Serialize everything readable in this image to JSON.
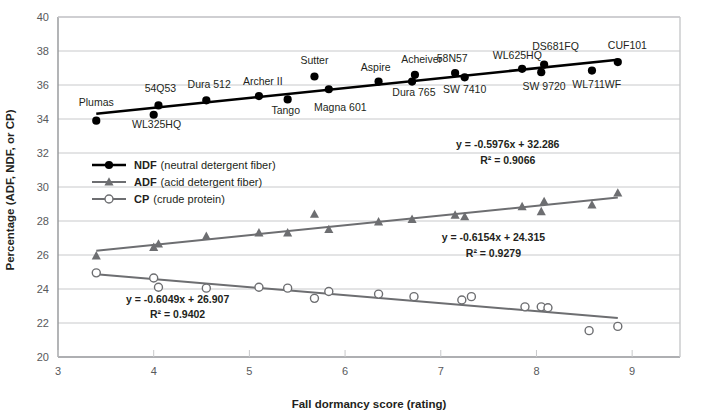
{
  "chart_data": {
    "type": "scatter",
    "title": "",
    "xlabel": "Fall dormancy score (rating)",
    "ylabel": "Percentage (ADF, NDF, or CP)",
    "xlim": [
      3,
      9.5
    ],
    "ylim": [
      20,
      40
    ],
    "xticks": [
      3,
      4,
      5,
      6,
      7,
      8,
      9
    ],
    "yticks": [
      20,
      22,
      24,
      26,
      28,
      30,
      32,
      34,
      36,
      38,
      40
    ],
    "grid": true,
    "legend_position": "inside-upper-left",
    "series": [
      {
        "name": "NDF",
        "legend_key": "NDF",
        "legend_desc": "(neutral detergent fiber)",
        "marker": "filled-circle",
        "color": "#000000",
        "equation": "y = -0.5976x + 32.286",
        "r2": "R² = 0.9066",
        "trend_slope": 0.5976,
        "trend_intercept": 32.286,
        "points": [
          {
            "label": "Plumas",
            "x": 3.4,
            "y": 33.9,
            "lx": 3.4,
            "ly": 34.75,
            "anchor": "middle"
          },
          {
            "label": "WL325HQ",
            "x": 4.0,
            "y": 34.25,
            "lx": 4.03,
            "ly": 33.45,
            "anchor": "middle"
          },
          {
            "label": "54Q53",
            "x": 4.05,
            "y": 34.8,
            "lx": 4.07,
            "ly": 35.6,
            "anchor": "middle"
          },
          {
            "label": "Dura 512",
            "x": 4.55,
            "y": 35.1,
            "lx": 4.58,
            "ly": 35.8,
            "anchor": "middle"
          },
          {
            "label": "Archer II",
            "x": 5.1,
            "y": 35.35,
            "lx": 5.14,
            "ly": 36.0,
            "anchor": "middle"
          },
          {
            "label": "Tango",
            "x": 5.4,
            "y": 35.15,
            "lx": 5.38,
            "ly": 34.3,
            "anchor": "middle"
          },
          {
            "label": "Sutter",
            "x": 5.68,
            "y": 36.5,
            "lx": 5.68,
            "ly": 37.25,
            "anchor": "middle"
          },
          {
            "label": "Magna 601",
            "x": 5.83,
            "y": 35.75,
            "lx": 5.95,
            "ly": 34.5,
            "anchor": "middle"
          },
          {
            "label": "Aspire",
            "x": 6.35,
            "y": 36.2,
            "lx": 6.32,
            "ly": 36.85,
            "anchor": "middle"
          },
          {
            "label": "Dura 765",
            "x": 6.7,
            "y": 36.2,
            "lx": 6.72,
            "ly": 35.35,
            "anchor": "middle"
          },
          {
            "label": "Acheiver",
            "x": 6.73,
            "y": 36.6,
            "lx": 6.8,
            "ly": 37.3,
            "anchor": "middle"
          },
          {
            "label": "SW 7410",
            "x": 7.25,
            "y": 36.45,
            "lx": 7.25,
            "ly": 35.55,
            "anchor": "middle"
          },
          {
            "label": "58N57",
            "x": 7.15,
            "y": 36.7,
            "lx": 7.12,
            "ly": 37.35,
            "anchor": "middle"
          },
          {
            "label": "SW 9720",
            "x": 8.05,
            "y": 36.75,
            "lx": 8.08,
            "ly": 35.7,
            "anchor": "middle"
          },
          {
            "label": "WL625HQ",
            "x": 7.85,
            "y": 36.95,
            "lx": 7.8,
            "ly": 37.55,
            "anchor": "middle"
          },
          {
            "label": "DS681FQ",
            "x": 8.08,
            "y": 37.2,
            "lx": 8.2,
            "ly": 38.05,
            "anchor": "middle"
          },
          {
            "label": "WL711WF",
            "x": 8.58,
            "y": 36.85,
            "lx": 8.63,
            "ly": 35.85,
            "anchor": "middle"
          },
          {
            "label": "CUF101",
            "x": 8.85,
            "y": 37.35,
            "lx": 8.95,
            "ly": 38.1,
            "anchor": "middle"
          }
        ]
      },
      {
        "name": "ADF",
        "legend_key": "ADF",
        "legend_desc": "(acid detergent fiber)",
        "marker": "filled-triangle",
        "color": "#6d6e71",
        "equation": "y = -0.6154x + 24.315",
        "r2": "R² = 0.9279",
        "trend_slope": 0.6154,
        "trend_intercept": 24.315,
        "points": [
          {
            "x": 3.4,
            "y": 25.95
          },
          {
            "x": 4.0,
            "y": 26.45
          },
          {
            "x": 4.05,
            "y": 26.65
          },
          {
            "x": 4.55,
            "y": 27.1
          },
          {
            "x": 5.1,
            "y": 27.3
          },
          {
            "x": 5.4,
            "y": 27.3
          },
          {
            "x": 5.68,
            "y": 28.4
          },
          {
            "x": 5.83,
            "y": 27.5
          },
          {
            "x": 6.35,
            "y": 27.95
          },
          {
            "x": 6.7,
            "y": 28.1
          },
          {
            "x": 7.15,
            "y": 28.35
          },
          {
            "x": 7.25,
            "y": 28.25
          },
          {
            "x": 7.85,
            "y": 28.85
          },
          {
            "x": 8.05,
            "y": 28.55
          },
          {
            "x": 8.08,
            "y": 29.15
          },
          {
            "x": 8.58,
            "y": 28.95
          },
          {
            "x": 8.85,
            "y": 29.65
          }
        ]
      },
      {
        "name": "CP",
        "legend_key": "CP",
        "legend_desc": "(crude protein)",
        "marker": "open-circle",
        "color": "#6d6e71",
        "equation": "y = -0.6049x + 26.907",
        "r2": "R² = 0.9402",
        "trend_slope": -0.6049,
        "trend_intercept": 26.907,
        "points": [
          {
            "x": 3.4,
            "y": 24.95
          },
          {
            "x": 4.0,
            "y": 24.65
          },
          {
            "x": 4.05,
            "y": 24.1
          },
          {
            "x": 4.55,
            "y": 24.05
          },
          {
            "x": 5.1,
            "y": 24.1
          },
          {
            "x": 5.4,
            "y": 24.05
          },
          {
            "x": 5.68,
            "y": 23.45
          },
          {
            "x": 5.83,
            "y": 23.85
          },
          {
            "x": 6.35,
            "y": 23.7
          },
          {
            "x": 6.72,
            "y": 23.55
          },
          {
            "x": 7.22,
            "y": 23.35
          },
          {
            "x": 7.32,
            "y": 23.55
          },
          {
            "x": 7.88,
            "y": 22.95
          },
          {
            "x": 8.05,
            "y": 22.95
          },
          {
            "x": 8.12,
            "y": 22.9
          },
          {
            "x": 8.55,
            "y": 21.55
          },
          {
            "x": 8.85,
            "y": 21.8
          }
        ]
      }
    ],
    "annotations": [
      {
        "name": "ndf-equation",
        "text": "y = -0.5976x + 32.286",
        "x": 7.7,
        "y": 32.3
      },
      {
        "name": "ndf-r2",
        "text": "R² = 0.9066",
        "x": 7.7,
        "y": 31.35
      },
      {
        "name": "adf-equation",
        "text": "y = -0.6154x + 24.315",
        "x": 7.55,
        "y": 26.8
      },
      {
        "name": "adf-r2",
        "text": "R² = 0.9279",
        "x": 7.55,
        "y": 25.9
      },
      {
        "name": "cp-equation",
        "text": "y = -0.6049x + 26.907",
        "x": 4.25,
        "y": 23.15
      },
      {
        "name": "cp-r2",
        "text": "R² = 0.9402",
        "x": 4.25,
        "y": 22.3
      }
    ]
  }
}
